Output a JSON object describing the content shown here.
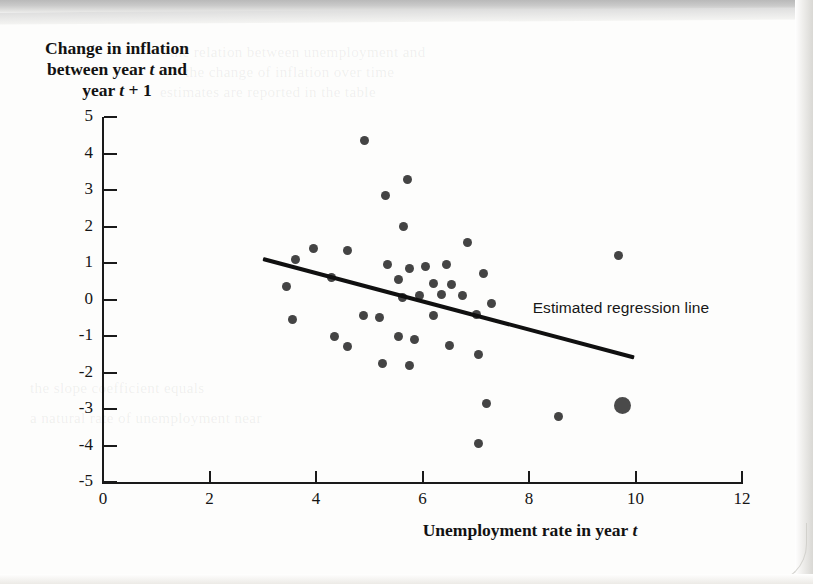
{
  "figure": {
    "y_axis_label_lines": [
      "Change in inflation",
      "between year t and",
      "year t + 1"
    ],
    "x_axis_label": "Unemployment rate in year t",
    "annotation": "Estimated regression line"
  },
  "chart_data": {
    "type": "scatter",
    "title": "",
    "xlabel": "Unemployment rate in year t",
    "ylabel": "Change in inflation between year t and year t + 1",
    "xlim": [
      0,
      12
    ],
    "ylim": [
      -5,
      5
    ],
    "xticks": [
      0,
      2,
      4,
      6,
      8,
      10,
      12
    ],
    "yticks": [
      5,
      4,
      3,
      2,
      1,
      0,
      -1,
      -2,
      -3,
      -4,
      -5
    ],
    "grid": false,
    "legend": false,
    "annotations": [
      {
        "text": "Estimated regression line",
        "x": 8.5,
        "y": -0.25
      }
    ],
    "series": [
      {
        "name": "Observations",
        "marker": "circle",
        "color": "#444444",
        "points": [
          {
            "x": 4.92,
            "y": 4.35
          },
          {
            "x": 5.72,
            "y": 3.3
          },
          {
            "x": 5.3,
            "y": 2.85
          },
          {
            "x": 5.65,
            "y": 2.0
          },
          {
            "x": 3.95,
            "y": 1.4
          },
          {
            "x": 4.6,
            "y": 1.35
          },
          {
            "x": 6.85,
            "y": 1.55
          },
          {
            "x": 3.62,
            "y": 1.1
          },
          {
            "x": 5.35,
            "y": 0.95
          },
          {
            "x": 5.75,
            "y": 0.85
          },
          {
            "x": 6.05,
            "y": 0.9
          },
          {
            "x": 6.45,
            "y": 0.95
          },
          {
            "x": 4.3,
            "y": 0.6
          },
          {
            "x": 5.55,
            "y": 0.55
          },
          {
            "x": 6.2,
            "y": 0.45
          },
          {
            "x": 6.55,
            "y": 0.4
          },
          {
            "x": 7.15,
            "y": 0.7
          },
          {
            "x": 3.45,
            "y": 0.35
          },
          {
            "x": 5.95,
            "y": 0.1
          },
          {
            "x": 6.35,
            "y": 0.15
          },
          {
            "x": 5.62,
            "y": 0.05
          },
          {
            "x": 6.75,
            "y": 0.1
          },
          {
            "x": 7.3,
            "y": -0.1
          },
          {
            "x": 3.55,
            "y": -0.55
          },
          {
            "x": 4.9,
            "y": -0.45
          },
          {
            "x": 5.2,
            "y": -0.5
          },
          {
            "x": 6.2,
            "y": -0.45
          },
          {
            "x": 7.02,
            "y": -0.4
          },
          {
            "x": 4.35,
            "y": -1.0
          },
          {
            "x": 4.6,
            "y": -1.3
          },
          {
            "x": 5.55,
            "y": -1.0
          },
          {
            "x": 5.85,
            "y": -1.1
          },
          {
            "x": 6.5,
            "y": -1.25
          },
          {
            "x": 7.05,
            "y": -1.5
          },
          {
            "x": 5.25,
            "y": -1.75
          },
          {
            "x": 5.75,
            "y": -1.8
          },
          {
            "x": 7.2,
            "y": -2.85
          },
          {
            "x": 8.55,
            "y": -3.2
          },
          {
            "x": 7.05,
            "y": -3.95
          },
          {
            "x": 9.68,
            "y": 1.2
          }
        ]
      },
      {
        "name": "Highlighted observation",
        "marker": "large-circle",
        "color": "#4a4a4a",
        "points": [
          {
            "x": 9.75,
            "y": -2.9
          }
        ]
      }
    ],
    "regression_line": {
      "label": "Estimated regression line",
      "color": "#101010",
      "x_start": 3.0,
      "y_start": 1.1,
      "x_end": 9.97,
      "y_end": -1.6
    }
  },
  "background_ghost_lines": [
    "the relation between unemployment and",
    "the change of inflation over time",
    "estimates are reported in the table",
    "the slope coefficient equals",
    "a natural rate of unemployment near"
  ]
}
